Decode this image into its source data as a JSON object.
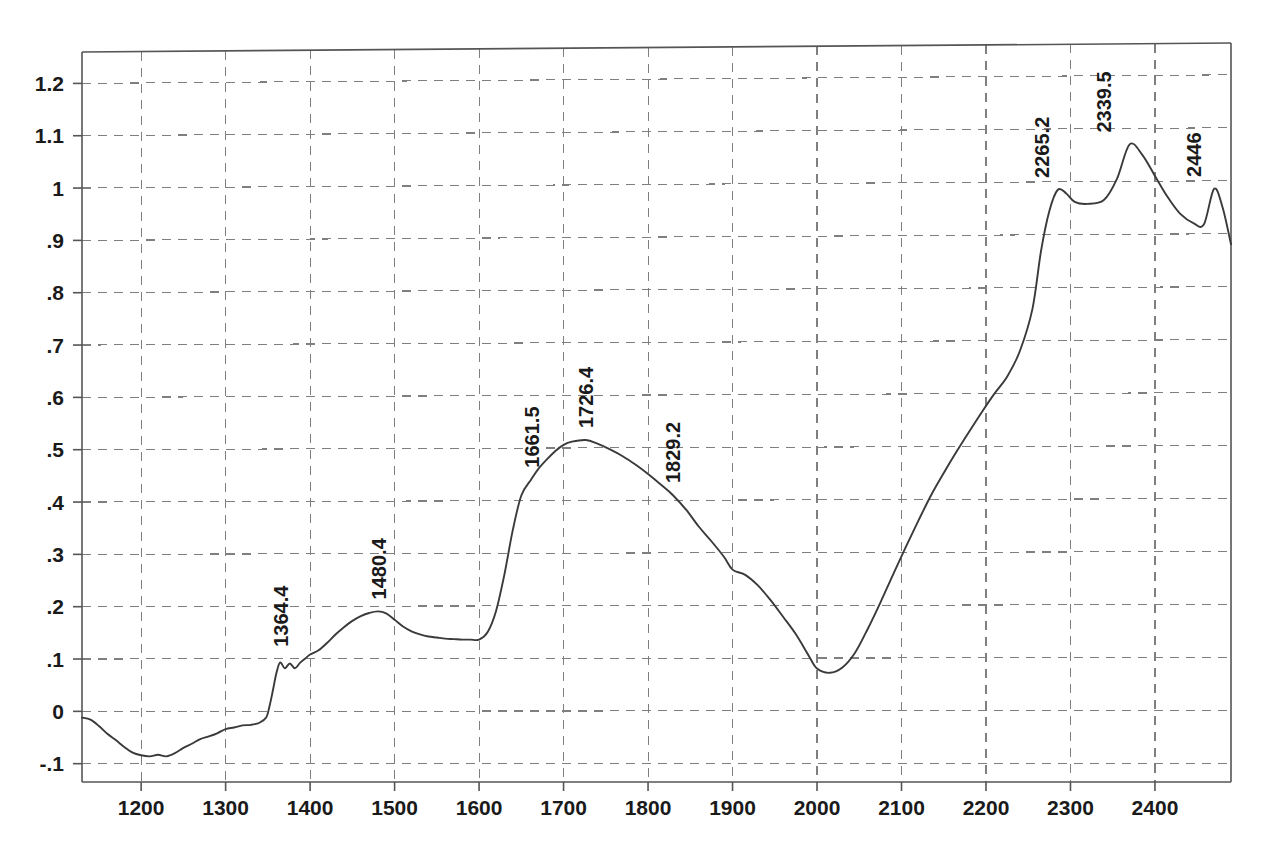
{
  "chart_data": {
    "type": "line",
    "title": "",
    "subtitle": "",
    "xlabel": "",
    "ylabel": "",
    "xlim": [
      1130,
      2490
    ],
    "ylim": [
      -0.135,
      1.26
    ],
    "grid": true,
    "legend": "none",
    "line_color": "#3a3a3a",
    "axis_color": "#555555",
    "grid_color": "#7f7f7f",
    "grid_style": "dashed",
    "background": "#ffffff",
    "x_ticks": [
      1200,
      1300,
      1400,
      1500,
      1600,
      1700,
      1800,
      1900,
      2000,
      2100,
      2200,
      2300,
      2400
    ],
    "x_tick_labels": [
      "1200",
      "1300",
      "1400",
      "1500",
      "1600",
      "1700",
      "1800",
      "1900",
      "2000",
      "2100",
      "2200",
      "2300",
      "2400"
    ],
    "y_ticks": [
      -0.1,
      0,
      0.1,
      0.2,
      0.3,
      0.4,
      0.5,
      0.6,
      0.7,
      0.8,
      0.9,
      1.0,
      1.1,
      1.2
    ],
    "y_tick_labels": [
      "-.1",
      "0",
      ".1",
      ".2",
      ".3",
      ".4",
      ".5",
      ".6",
      ".7",
      ".8",
      ".9",
      "1",
      "1.1",
      "1.2"
    ],
    "annotations": [
      {
        "label": "1364.4",
        "x": 1364.4,
        "y": 0.1
      },
      {
        "label": "1480.4",
        "x": 1480.4,
        "y": 0.19
      },
      {
        "label": "1661.5",
        "x": 1661.5,
        "y": 0.44
      },
      {
        "label": "1726.4",
        "x": 1726.4,
        "y": 0.515
      },
      {
        "label": "1829.2",
        "x": 1829.2,
        "y": 0.41
      },
      {
        "label": "2265.2",
        "x": 2265.2,
        "y": 0.985
      },
      {
        "label": "2339.5",
        "x": 2339.5,
        "y": 1.07
      },
      {
        "label": "2446",
        "x": 2446.0,
        "y": 0.985
      }
    ],
    "x": [
      1130,
      1140,
      1150,
      1160,
      1170,
      1180,
      1190,
      1200,
      1210,
      1220,
      1230,
      1240,
      1250,
      1260,
      1270,
      1280,
      1290,
      1300,
      1310,
      1320,
      1330,
      1340,
      1348,
      1352,
      1356,
      1360,
      1364.4,
      1370,
      1376,
      1382,
      1388,
      1394,
      1400,
      1410,
      1420,
      1430,
      1440,
      1450,
      1460,
      1470,
      1480.4,
      1490,
      1500,
      1510,
      1520,
      1530,
      1540,
      1550,
      1560,
      1570,
      1580,
      1590,
      1600,
      1610,
      1620,
      1630,
      1640,
      1650,
      1661.5,
      1670,
      1680,
      1690,
      1700,
      1710,
      1726.4,
      1740,
      1755,
      1770,
      1785,
      1800,
      1815,
      1829.2,
      1845,
      1860,
      1875,
      1890,
      1900,
      1915,
      1930,
      1945,
      1960,
      1975,
      1990,
      2000,
      2015,
      2030,
      2045,
      2060,
      2075,
      2090,
      2105,
      2120,
      2135,
      2150,
      2165,
      2180,
      2195,
      2210,
      2225,
      2240,
      2255,
      2265.2,
      2275,
      2285,
      2295,
      2305,
      2320,
      2339.5,
      2355,
      2370,
      2385,
      2400,
      2415,
      2430,
      2446,
      2458,
      2470,
      2480,
      2490
    ],
    "y": [
      -0.012,
      -0.016,
      -0.028,
      -0.043,
      -0.055,
      -0.068,
      -0.079,
      -0.084,
      -0.086,
      -0.083,
      -0.086,
      -0.08,
      -0.07,
      -0.062,
      -0.053,
      -0.048,
      -0.042,
      -0.034,
      -0.031,
      -0.027,
      -0.026,
      -0.022,
      -0.012,
      0.01,
      0.04,
      0.072,
      0.093,
      0.082,
      0.091,
      0.082,
      0.092,
      0.1,
      0.108,
      0.116,
      0.13,
      0.146,
      0.16,
      0.172,
      0.181,
      0.187,
      0.19,
      0.186,
      0.174,
      0.161,
      0.152,
      0.146,
      0.142,
      0.14,
      0.138,
      0.137,
      0.136,
      0.136,
      0.136,
      0.15,
      0.19,
      0.26,
      0.345,
      0.41,
      0.44,
      0.46,
      0.478,
      0.494,
      0.506,
      0.512,
      0.515,
      0.508,
      0.497,
      0.484,
      0.468,
      0.45,
      0.43,
      0.41,
      0.382,
      0.35,
      0.322,
      0.292,
      0.268,
      0.258,
      0.238,
      0.21,
      0.178,
      0.145,
      0.105,
      0.08,
      0.072,
      0.082,
      0.11,
      0.155,
      0.205,
      0.258,
      0.31,
      0.36,
      0.408,
      0.45,
      0.49,
      0.528,
      0.565,
      0.6,
      0.632,
      0.68,
      0.76,
      0.87,
      0.945,
      0.985,
      0.978,
      0.962,
      0.958,
      0.965,
      1.005,
      1.07,
      1.05,
      1.01,
      0.97,
      0.938,
      0.92,
      0.918,
      0.985,
      0.95,
      0.88,
      0.828,
      0.79
    ]
  },
  "plot_frame": {
    "left": 82,
    "right": 1231,
    "top": 52,
    "bottom": 782,
    "top_right": 43
  }
}
